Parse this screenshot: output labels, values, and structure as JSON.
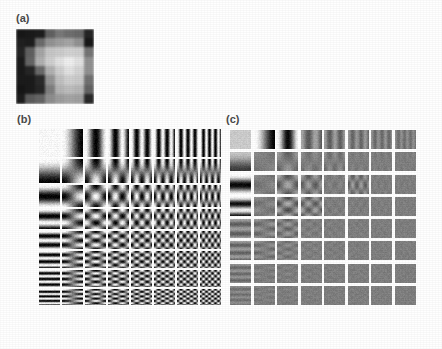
{
  "figure": {
    "background": "#ffffff",
    "width": 442,
    "height": 349,
    "label_color": "#4a4a4a"
  },
  "panels": [
    {
      "id": "a",
      "label": "(a)",
      "label_x": 16,
      "label_y": 12,
      "x": 16,
      "y": 29,
      "width": 78,
      "height": 75,
      "type": "image-block",
      "grid": 8,
      "description": "8 by 8 grayscale image block",
      "pixels": [
        [
          28,
          24,
          26,
          96,
          118,
          112,
          104,
          34
        ],
        [
          30,
          26,
          112,
          150,
          158,
          162,
          150,
          30
        ],
        [
          34,
          96,
          168,
          196,
          206,
          214,
          206,
          120
        ],
        [
          30,
          104,
          176,
          212,
          228,
          236,
          228,
          150
        ],
        [
          26,
          36,
          110,
          182,
          210,
          222,
          216,
          146
        ],
        [
          24,
          28,
          46,
          150,
          196,
          206,
          198,
          112
        ],
        [
          26,
          30,
          40,
          128,
          178,
          190,
          180,
          96
        ],
        [
          30,
          86,
          102,
          140,
          160,
          168,
          158,
          44
        ]
      ]
    },
    {
      "id": "b",
      "label": "(b)",
      "label_x": 17,
      "label_y": 113,
      "x": 38,
      "y": 128,
      "width": 184,
      "height": 178,
      "type": "dct-basis-grid",
      "grid": 8,
      "gridline_color": "#ffffff",
      "gridline_width": 2,
      "contrast": 1.0,
      "description": "8 by 8 array of two dimensional DCT basis functions, full contrast",
      "amplitudes": [
        [
          1.0,
          1.0,
          1.0,
          1.0,
          1.0,
          1.0,
          1.0,
          1.0
        ],
        [
          1.0,
          1.0,
          1.0,
          1.0,
          1.0,
          1.0,
          1.0,
          1.0
        ],
        [
          1.0,
          1.0,
          1.0,
          1.0,
          1.0,
          1.0,
          1.0,
          1.0
        ],
        [
          1.0,
          1.0,
          1.0,
          1.0,
          1.0,
          1.0,
          1.0,
          1.0
        ],
        [
          1.0,
          1.0,
          1.0,
          1.0,
          1.0,
          1.0,
          1.0,
          1.0
        ],
        [
          1.0,
          1.0,
          1.0,
          1.0,
          1.0,
          1.0,
          1.0,
          1.0
        ],
        [
          1.0,
          1.0,
          1.0,
          1.0,
          1.0,
          1.0,
          1.0,
          1.0
        ],
        [
          1.0,
          1.0,
          1.0,
          1.0,
          1.0,
          1.0,
          1.0,
          1.0
        ]
      ],
      "row_heights": [
        30,
        26,
        24,
        22,
        20,
        19,
        19,
        18
      ]
    },
    {
      "id": "c",
      "label": "(c)",
      "label_x": 226,
      "label_y": 113,
      "x": 228,
      "y": 128,
      "width": 188,
      "height": 178,
      "type": "dct-weighted-grid",
      "grid": 8,
      "gridline_color": "#ffffff",
      "gridline_width": 3,
      "base_gray": 128,
      "description": "8 by 8 array of DCT basis functions scaled by their coefficient magnitudes; most are near flat mid gray",
      "amplitudes": [
        [
          0.62,
          1.0,
          0.92,
          0.3,
          0.26,
          0.2,
          0.17,
          0.13
        ],
        [
          0.55,
          0.07,
          0.22,
          0.12,
          0.15,
          0.06,
          0.05,
          0.04
        ],
        [
          0.95,
          0.1,
          0.34,
          0.28,
          0.07,
          0.26,
          0.05,
          0.04
        ],
        [
          0.88,
          0.12,
          0.4,
          0.3,
          0.06,
          0.05,
          0.04,
          0.03
        ],
        [
          0.26,
          0.22,
          0.24,
          0.08,
          0.05,
          0.04,
          0.03,
          0.03
        ],
        [
          0.22,
          0.18,
          0.14,
          0.06,
          0.05,
          0.04,
          0.03,
          0.03
        ],
        [
          0.17,
          0.09,
          0.07,
          0.05,
          0.04,
          0.03,
          0.03,
          0.02
        ],
        [
          0.12,
          0.07,
          0.05,
          0.04,
          0.03,
          0.03,
          0.02,
          0.02
        ]
      ],
      "dc_gray": 205
    }
  ]
}
